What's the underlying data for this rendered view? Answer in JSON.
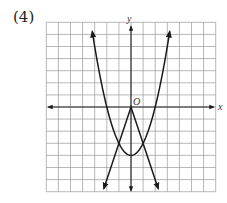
{
  "problem": {
    "label": "(4)"
  },
  "chart_data": {
    "type": "line",
    "title": "",
    "xlabel": "x",
    "ylabel": "y",
    "origin_label": "O",
    "grid": true,
    "xlim": [
      -7,
      7
    ],
    "ylim": [
      -7,
      7
    ],
    "grid_step": 1,
    "series": [
      {
        "name": "parabola",
        "equation": "y = x^2 - 4",
        "vertex": [
          0,
          -4
        ],
        "x_range": [
          -3.2,
          3.2
        ],
        "arrows": "both-ends"
      },
      {
        "name": "absolute-value",
        "equation": "y = -3|x|",
        "vertex": [
          0,
          0
        ],
        "x_range": [
          -2.25,
          2.25
        ],
        "arrows": "both-ends"
      }
    ],
    "intersections": [
      [
        -1,
        -3
      ],
      [
        1,
        -3
      ]
    ],
    "colors": {
      "grid": "#9a9a9a",
      "curve": "#1a1a1a",
      "axis": "#222222"
    }
  }
}
